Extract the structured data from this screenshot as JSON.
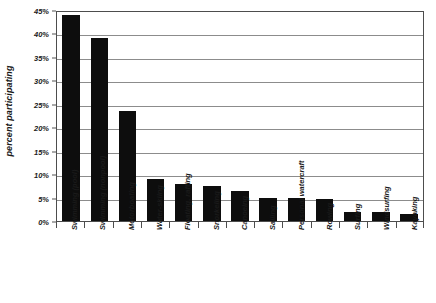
{
  "chart_data": {
    "type": "bar",
    "title": "",
    "subtitle": "",
    "xlabel": "",
    "ylabel": "percent participating",
    "ylim": [
      0,
      45
    ],
    "grid": true,
    "legend": "none",
    "orientation": "vertical",
    "bar_color": "#0d0d0d",
    "categories": [
      "Swimming (pool)",
      "Swimming (nonpool)",
      "Motorboating",
      "Water-skiing",
      "Floating, rafting",
      "Snorkeling",
      "Canoeing",
      "Sailing",
      "Personal watercraft",
      "Rowing",
      "Surfing",
      "Windsurfing",
      "Kayaking"
    ],
    "values": [
      44,
      39,
      23.5,
      9,
      8,
      7.5,
      6.5,
      5,
      5,
      4.8,
      2,
      2,
      1.5
    ],
    "value_labels": [
      "44%",
      "39%",
      "23.5%",
      "9%",
      "8%",
      "7.5%",
      "6.5%",
      "5%",
      "5%",
      "4.8%",
      "2%",
      "2%",
      "1.5%"
    ],
    "ytick_values": [
      0,
      5,
      10,
      15,
      20,
      25,
      30,
      35,
      40,
      45
    ],
    "ytick_labels": [
      "0%",
      "5%",
      "10%",
      "15%",
      "20%",
      "25%",
      "30%",
      "35%",
      "40%",
      "45%"
    ]
  },
  "axis": {
    "y_title": "percent participating"
  }
}
